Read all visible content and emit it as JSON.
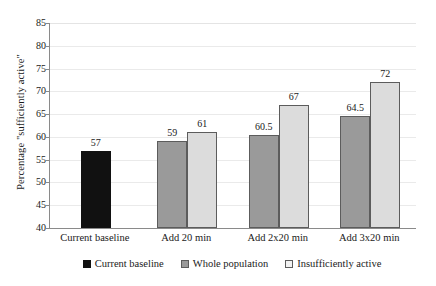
{
  "chart_data": {
    "type": "bar",
    "title": "",
    "subtitle": "",
    "xlabel": "",
    "ylabel": "Percentage \"sufficiently active\"",
    "categories": [
      "Current baseline",
      "Add 20 min",
      "Add 2x20 min",
      "Add 3x20 min"
    ],
    "series": [
      {
        "name": "Current baseline",
        "color": "#111111",
        "values": [
          57,
          null,
          null,
          null
        ]
      },
      {
        "name": "Whole population",
        "color": "#9a9a9a",
        "values": [
          null,
          59,
          60.5,
          64.5
        ]
      },
      {
        "name": "Insufficiently active",
        "color": "#dcdcdc",
        "values": [
          null,
          61,
          67,
          72
        ]
      }
    ],
    "ylim": [
      40,
      85
    ],
    "yticks": [
      85,
      80,
      75,
      70,
      65,
      60,
      55,
      50,
      45,
      40
    ],
    "ytick_labels": [
      "85",
      "80",
      "75",
      "70",
      "65",
      "60",
      "55",
      "50",
      "45",
      "40"
    ],
    "bar_labels": {
      "current_baseline": [
        "57"
      ],
      "add_20_min": [
        "59",
        "61"
      ],
      "add_2x20_min": [
        "60.5",
        "67"
      ],
      "add_3x20_min": [
        "64.5",
        "72"
      ]
    },
    "grid": "horizontal",
    "legend_position": "bottom"
  },
  "legend": {
    "items": [
      {
        "label": "Current baseline",
        "swatch": "series-baseline"
      },
      {
        "label": "Whole population",
        "swatch": "series-whole"
      },
      {
        "label": "Insufficiently active",
        "swatch": "series-insufficient"
      }
    ]
  }
}
